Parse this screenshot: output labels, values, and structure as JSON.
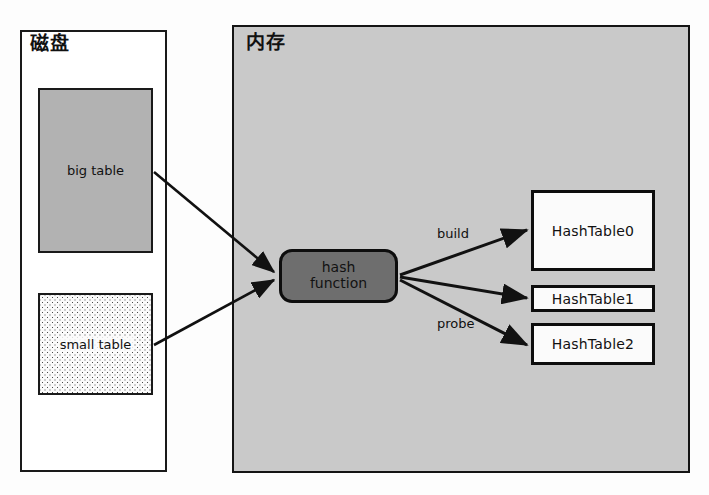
{
  "diagram": {
    "containers": {
      "disk": {
        "label": "磁盘"
      },
      "memory": {
        "label": "内存"
      }
    },
    "disk_tables": [
      {
        "id": "big-table",
        "label": "big table",
        "fill": "#b2b2b2"
      },
      {
        "id": "small-table",
        "label": "small table",
        "fill": "dotted"
      }
    ],
    "hash_node": {
      "line1": "hash",
      "line2": "function",
      "fill": "#6e6e6e"
    },
    "hash_tables": [
      {
        "id": "hashtable0",
        "label": "HashTable0"
      },
      {
        "id": "hashtable1",
        "label": "HashTable1"
      },
      {
        "id": "hashtable2",
        "label": "HashTable2"
      }
    ],
    "edge_labels": {
      "build": "build",
      "probe": "probe"
    },
    "colors": {
      "memory_fill": "#c9c9c9",
      "big_table_fill": "#b2b2b2",
      "hash_node_fill": "#6e6e6e",
      "hash_table_fill": "#fbfbfb",
      "stroke": "#111111",
      "page_background": "#fdfdfd"
    }
  }
}
